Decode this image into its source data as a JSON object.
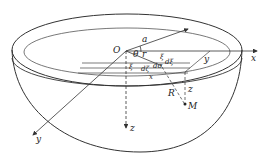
{
  "diagram": {
    "labels": {
      "origin": "O",
      "radius_a": "a",
      "angle": "θ",
      "r": "r",
      "x_axis": "x",
      "y_axis": "y",
      "z_axis": "z",
      "xi": "ξ",
      "d_xi": "dξ",
      "xi_right": "ξ",
      "d_zeta": "dζ",
      "x_dist": "x",
      "y_dist": "y",
      "z_dist": "z",
      "R": "R",
      "point_M": "M",
      "d_omega": "dσ"
    },
    "colors": {
      "stroke": "#333333",
      "background": "#ffffff"
    }
  }
}
